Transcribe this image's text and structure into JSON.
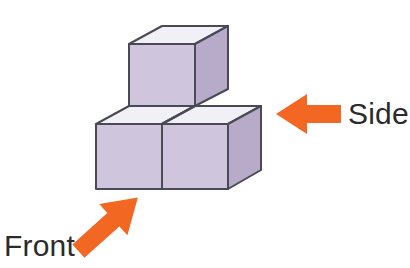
{
  "figure": {
    "title": "",
    "background_color": "#ffffff",
    "cube_colors": {
      "top_face": "#f1f0f7",
      "left_face": "#cfc6de",
      "right_face": "#b7abc9",
      "outline": "#4a4a55"
    },
    "arrow_color": "#f26722",
    "label_color": "#2b2b2b",
    "cubes": [
      {
        "name": "back-upper-cube",
        "position": "top"
      },
      {
        "name": "front-left-cube",
        "position": "front-left"
      },
      {
        "name": "right-cube",
        "position": "right"
      }
    ]
  },
  "labels": {
    "side": "Side",
    "front": "Front"
  },
  "arrows": {
    "side_arrow_name": "side-direction-arrow",
    "side_arrow_direction": "left",
    "front_arrow_name": "front-direction-arrow",
    "front_arrow_direction": "up-right"
  },
  "clipped_header": " "
}
